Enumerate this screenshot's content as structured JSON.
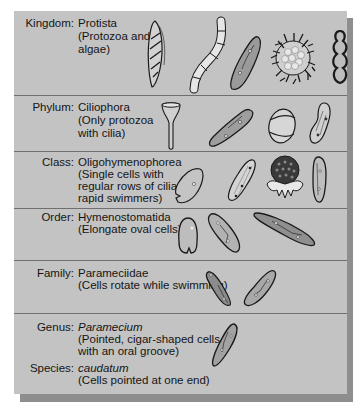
{
  "figure": {
    "colors": {
      "panel_bg": "#c3c3c3",
      "shadow": "#8e8e8e",
      "divider": "#6f6f6f",
      "text": "#151515",
      "organism_fill": "#9a9a9a",
      "organism_outline": "#1a1a1a"
    },
    "ranks": [
      {
        "rank": "Kingdom:",
        "name": "Protista",
        "desc_lines": [
          "(Protozoa and",
          "algae)"
        ],
        "organisms": [
          "euglenoid-cell-icon",
          "filamentous-alga-icon",
          "paramecium-icon",
          "radiolarian-icon",
          "wavy-amoeba-icon"
        ]
      },
      {
        "rank": "Phylum:",
        "name": "Ciliophora",
        "desc_lines": [
          "(Only protozoa",
          "with cilia)"
        ],
        "organisms": [
          "stentor-funnel-icon",
          "paramecium-icon",
          "banded-ciliate-icon",
          "curved-ciliate-icon"
        ]
      },
      {
        "rank": "Class:",
        "name": "Oligohymenophorea",
        "desc_lines": [
          "(Single cells with",
          "regular rows of cilia;",
          "rapid swimmers)"
        ],
        "organisms": [
          "notched-ciliate-icon",
          "tetrahymena-icon",
          "vorticella-bell-icon",
          "slipper-ciliate-icon"
        ]
      },
      {
        "rank": "Order:",
        "name": "Hymenostomatida",
        "desc_lines": [
          "(Elongate oval cells)"
        ],
        "organisms": [
          "oval-cell-icon",
          "paramecium-icon",
          "elongate-paramecium-icon"
        ]
      },
      {
        "rank": "Family:",
        "name": "Parameciidae",
        "desc_lines": [
          "(Cells rotate while swimming)"
        ],
        "organisms": [
          "paramecium-icon",
          "paramecium-icon"
        ]
      },
      {
        "rank": "Genus:",
        "name": "Paramecium",
        "name_italic": true,
        "desc_lines": [
          "(Pointed, cigar-shaped cells",
          "with an oral groove)"
        ],
        "organisms": [
          "paramecium-caudatum-icon"
        ]
      },
      {
        "rank": "Species:",
        "name": "caudatum",
        "name_italic": true,
        "desc_lines": [
          "(Cells pointed at one end)"
        ],
        "organisms": []
      }
    ]
  }
}
